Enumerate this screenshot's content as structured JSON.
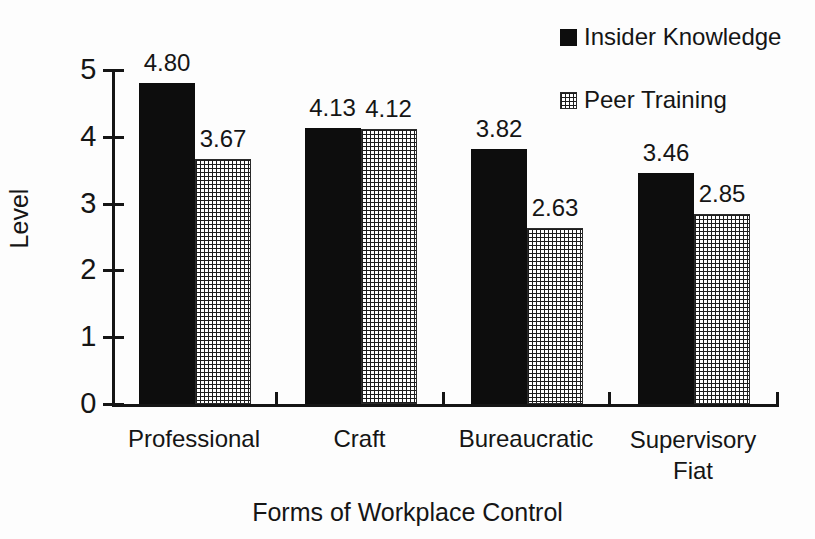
{
  "chart_data": {
    "type": "bar",
    "title": "",
    "subtitle": "",
    "xlabel": "Forms of Workplace Control",
    "ylabel": "Level",
    "categories": [
      "Professional",
      "Craft",
      "Bureaucratic",
      "Supervisory Fiat"
    ],
    "category_label_lines": [
      [
        "Professional"
      ],
      [
        "Craft"
      ],
      [
        "Bureaucratic"
      ],
      [
        "Supervisory",
        "Fiat"
      ]
    ],
    "series": [
      {
        "name": "Insider Knowledge",
        "fill": "solid-black",
        "color": "#0d0d0d",
        "values": [
          4.8,
          3.67,
          4.13,
          3.46
        ],
        "values_by_category": [
          4.8,
          4.13,
          3.82,
          3.46
        ],
        "data_labels": [
          "4.80",
          "4.13",
          "3.82",
          "3.46"
        ]
      },
      {
        "name": "Peer Training",
        "fill": "grid-hatch",
        "color": "#1d1d1d",
        "values_by_category": [
          3.67,
          4.12,
          2.63,
          2.85
        ],
        "data_labels": [
          "3.67",
          "4.12",
          "2.63",
          "2.85"
        ]
      }
    ],
    "ylim": [
      0,
      5
    ],
    "yticks": [
      0,
      1,
      2,
      3,
      4,
      5
    ],
    "ytick_labels": [
      "0",
      "1",
      "2",
      "3",
      "4",
      "5"
    ],
    "grid": false,
    "legend_position": "top-right",
    "legend_entries": [
      "Insider Knowledge",
      "Peer Training"
    ]
  },
  "axes": {
    "y_title": "Level",
    "x_title": "Forms of Workplace Control",
    "y_ticks": [
      {
        "value": "5",
        "num": 5
      },
      {
        "value": "4",
        "num": 4
      },
      {
        "value": "3",
        "num": 3
      },
      {
        "value": "2",
        "num": 2
      },
      {
        "value": "1",
        "num": 1
      },
      {
        "value": "0",
        "num": 0
      }
    ]
  },
  "legend": {
    "items": [
      {
        "label": "Insider Knowledge",
        "swatch": "solid"
      },
      {
        "label": "Peer Training",
        "swatch": "hatch"
      }
    ]
  },
  "groups": [
    {
      "name": "Professional",
      "line1": "Professional",
      "line2": "",
      "bars": [
        {
          "series": "Insider Knowledge",
          "value": 4.8,
          "label": "4.80",
          "style": "solid"
        },
        {
          "series": "Peer Training",
          "value": 3.67,
          "label": "3.67",
          "style": "hatch"
        }
      ]
    },
    {
      "name": "Craft",
      "line1": "Craft",
      "line2": "",
      "bars": [
        {
          "series": "Insider Knowledge",
          "value": 4.13,
          "label": "4.13",
          "style": "solid"
        },
        {
          "series": "Peer Training",
          "value": 4.12,
          "label": "4.12",
          "style": "hatch"
        }
      ]
    },
    {
      "name": "Bureaucratic",
      "line1": "Bureaucratic",
      "line2": "",
      "bars": [
        {
          "series": "Insider Knowledge",
          "value": 3.82,
          "label": "3.82",
          "style": "solid"
        },
        {
          "series": "Peer Training",
          "value": 2.63,
          "label": "2.63",
          "style": "hatch"
        }
      ]
    },
    {
      "name": "Supervisory Fiat",
      "line1": "Supervisory",
      "line2": "Fiat",
      "bars": [
        {
          "series": "Insider Knowledge",
          "value": 3.46,
          "label": "3.46",
          "style": "solid"
        },
        {
          "series": "Peer Training",
          "value": 2.85,
          "label": "2.85",
          "style": "hatch"
        }
      ]
    }
  ]
}
